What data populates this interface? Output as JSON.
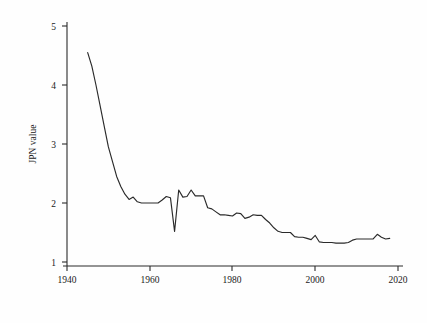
{
  "chart_data": {
    "type": "line",
    "title": "",
    "xlabel": "",
    "ylabel": "JPN value",
    "xlim": [
      1940,
      2020
    ],
    "ylim": [
      1,
      5
    ],
    "xticks": [
      1940,
      1960,
      1980,
      2000,
      2020
    ],
    "xtick_labels": [
      "1940",
      "1960",
      "1980",
      "2000",
      "2020"
    ],
    "yticks": [
      1,
      2,
      3,
      4,
      5
    ],
    "ytick_labels": [
      "1",
      "2",
      "3",
      "4",
      "5"
    ],
    "grid": false,
    "legend": "none",
    "line_color": "#2a2a2a",
    "background_color": "#fefefe",
    "series": [
      {
        "name": "JPN value",
        "x": [
          1945,
          1946,
          1947,
          1948,
          1949,
          1950,
          1951,
          1952,
          1953,
          1954,
          1955,
          1956,
          1957,
          1958,
          1959,
          1960,
          1961,
          1962,
          1963,
          1964,
          1965,
          1966,
          1967,
          1968,
          1969,
          1970,
          1971,
          1972,
          1973,
          1974,
          1975,
          1976,
          1977,
          1978,
          1979,
          1980,
          1981,
          1982,
          1983,
          1984,
          1985,
          1986,
          1987,
          1988,
          1989,
          1990,
          1991,
          1992,
          1993,
          1994,
          1995,
          1996,
          1997,
          1998,
          1999,
          2000,
          2001,
          2002,
          2003,
          2004,
          2005,
          2006,
          2007,
          2008,
          2009,
          2010,
          2011,
          2012,
          2013,
          2014,
          2015,
          2016,
          2017,
          2018
        ],
        "y": [
          4.55,
          4.32,
          4.0,
          3.65,
          3.3,
          2.95,
          2.7,
          2.45,
          2.28,
          2.15,
          2.06,
          2.1,
          2.02,
          2.0,
          2.0,
          2.0,
          2.0,
          2.0,
          2.05,
          2.11,
          2.09,
          1.52,
          2.22,
          2.1,
          2.11,
          2.22,
          2.12,
          2.12,
          2.12,
          1.92,
          1.9,
          1.85,
          1.8,
          1.8,
          1.79,
          1.78,
          1.83,
          1.82,
          1.74,
          1.76,
          1.8,
          1.79,
          1.79,
          1.72,
          1.66,
          1.58,
          1.52,
          1.5,
          1.5,
          1.5,
          1.43,
          1.42,
          1.42,
          1.4,
          1.38,
          1.45,
          1.34,
          1.33,
          1.33,
          1.33,
          1.32,
          1.32,
          1.32,
          1.33,
          1.37,
          1.39,
          1.39,
          1.39,
          1.39,
          1.39,
          1.47,
          1.42,
          1.39,
          1.4
        ]
      }
    ]
  },
  "figure": {
    "y_axis_title": "JPN value"
  }
}
